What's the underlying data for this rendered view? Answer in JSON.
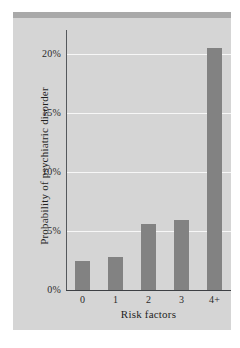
{
  "figure": {
    "background_color": "#ffffff",
    "panel_color": "#d5d5d5",
    "top_band_color": "#a9a9a9",
    "bar_color": "#828282",
    "gridline_color": "#f7f7f7",
    "axis_color": "#55585c",
    "text_color": "#1f1f1f"
  },
  "chart_data": {
    "type": "bar",
    "title": "",
    "subtitle": "",
    "xlabel": "Risk factors",
    "ylabel": "Probability of psychiatric disorder",
    "categories": [
      "0",
      "1",
      "2",
      "3",
      "4+"
    ],
    "values": [
      2.5,
      2.8,
      5.6,
      5.9,
      20.5
    ],
    "value_unit": "%",
    "ylim": [
      0,
      22
    ],
    "yticks": [
      0,
      5,
      10,
      15,
      20
    ],
    "ytick_labels": [
      "0%",
      "5%",
      "10%",
      "15%",
      "20%"
    ],
    "xtick_labels": [
      "0",
      "1",
      "2",
      "3",
      "4+"
    ],
    "grid": "horizontal",
    "gridline_values": [
      5,
      10,
      15,
      20
    ],
    "legend": null,
    "legend_position": "none",
    "annotations": [],
    "series": [
      {
        "name": "Probability of psychiatric disorder",
        "values": [
          2.5,
          2.8,
          5.6,
          5.9,
          20.5
        ]
      }
    ]
  }
}
